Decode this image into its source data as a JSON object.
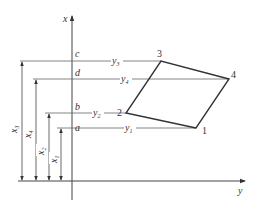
{
  "diagram": {
    "type": "coordinate-quadrilateral",
    "axes": {
      "vertical": {
        "label": "x"
      },
      "horizontal": {
        "label": "y"
      }
    },
    "vertices": [
      {
        "id": "1",
        "label": "1",
        "x_label": "x",
        "x_sub": "1",
        "y_label": "y",
        "y_sub": "1",
        "axis_point": "a"
      },
      {
        "id": "2",
        "label": "2",
        "x_label": "x",
        "x_sub": "2",
        "y_label": "y",
        "y_sub": "2",
        "axis_point": "b"
      },
      {
        "id": "3",
        "label": "3",
        "x_label": "x",
        "x_sub": "3",
        "y_label": "y",
        "y_sub": "3",
        "axis_point": "c"
      },
      {
        "id": "4",
        "label": "4",
        "x_label": "x",
        "x_sub": "4",
        "y_label": "y",
        "y_sub": "4",
        "axis_point": "d"
      }
    ],
    "axis_points": {
      "a": "a",
      "b": "b",
      "c": "c",
      "d": "d"
    }
  }
}
